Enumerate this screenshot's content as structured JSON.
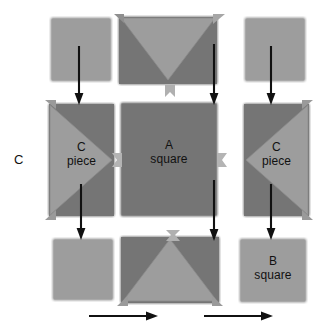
{
  "diagram": {
    "background": "#ffffff",
    "colors": {
      "light_fabric": "#9d9d9d",
      "dark_fabric": "#757575",
      "edge": "#8a8a8a",
      "arrow": "#111111",
      "text": "#111111",
      "connector": "#b4b4b4"
    },
    "side_label": "C",
    "pieces": [
      {
        "id": "r1c1",
        "kind": "plain-square",
        "fill": "light",
        "label_line1": "",
        "label_line2": ""
      },
      {
        "id": "r1c2",
        "kind": "rect-triangle-down",
        "fill": "dark",
        "label_line1": "",
        "label_line2": ""
      },
      {
        "id": "r1c3",
        "kind": "plain-square",
        "fill": "light",
        "label_line1": "",
        "label_line2": ""
      },
      {
        "id": "r2c1",
        "kind": "rect-triangle-left",
        "fill": "dark",
        "label_line1": "C",
        "label_line2": "piece"
      },
      {
        "id": "r2c2",
        "kind": "plain-square",
        "fill": "dark",
        "label_line1": "A",
        "label_line2": "square"
      },
      {
        "id": "r2c3",
        "kind": "rect-triangle-right",
        "fill": "dark",
        "label_line1": "C",
        "label_line2": "piece"
      },
      {
        "id": "r3c1",
        "kind": "plain-square",
        "fill": "light",
        "label_line1": "",
        "label_line2": ""
      },
      {
        "id": "r3c2",
        "kind": "rect-triangle-up",
        "fill": "dark",
        "label_line1": "",
        "label_line2": ""
      },
      {
        "id": "r3c3",
        "kind": "plain-square",
        "fill": "light",
        "label_line1": "B",
        "label_line2": "square"
      }
    ],
    "arrows": {
      "down_count": 6,
      "right_count": 2,
      "down_direction": "down",
      "right_direction": "right"
    }
  }
}
